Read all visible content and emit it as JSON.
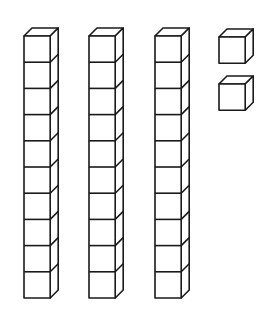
{
  "diagram": {
    "title": "",
    "stroke_color": "#1a1a1a",
    "fill_color": "#ffffff",
    "rods": [
      {
        "name": "ten-rod-1",
        "x": 24,
        "y": 36,
        "cubes": 10
      },
      {
        "name": "ten-rod-2",
        "x": 89,
        "y": 36,
        "cubes": 10
      },
      {
        "name": "ten-rod-3",
        "x": 155,
        "y": 36,
        "cubes": 10
      }
    ],
    "units": [
      {
        "name": "unit-cube-1",
        "x": 219,
        "y": 37
      },
      {
        "name": "unit-cube-2",
        "x": 219,
        "y": 84
      }
    ],
    "cube_size": 26.2,
    "depth": 8,
    "represented_value": 32
  }
}
